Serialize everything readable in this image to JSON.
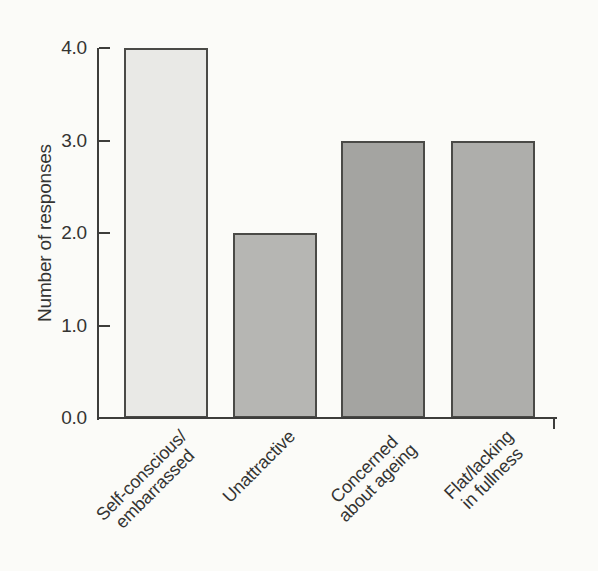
{
  "figure": {
    "background": "#fbfbf8",
    "axis_color": "#3d3d3b",
    "text_color": "#343432",
    "bar_border_color": "#4a4a47"
  },
  "chart_data": {
    "type": "bar",
    "title": "",
    "xlabel": "",
    "ylabel": "Number of responses",
    "ylim": [
      0,
      4
    ],
    "yticks": [
      "0.0",
      "1.0",
      "2.0",
      "3.0",
      "4.0"
    ],
    "grid": false,
    "legend": null,
    "categories": [
      "Self-conscious/\nembarrassed",
      "Unattractive",
      "Concerned\nabout ageing",
      "Flat/lacking\nin fullness"
    ],
    "values": [
      4,
      2,
      3,
      3
    ],
    "bar_colors": [
      "#e9e9e6",
      "#b6b6b3",
      "#a4a4a1",
      "#aeaeab"
    ]
  }
}
